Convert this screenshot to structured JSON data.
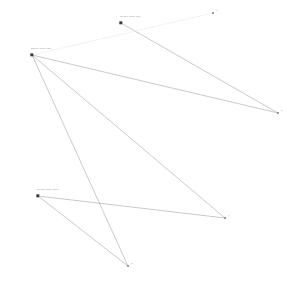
{
  "canvas": {
    "width": 290,
    "height": 292,
    "background": "#ffffff"
  },
  "style": {
    "node_color": "#3a3a3a",
    "endpoint_color": "#9a9a9a",
    "link_color": "#7a7a7a",
    "faint_link_color": "#e2e2e2",
    "caption_color": "#8d8d8d"
  },
  "chart_data": {
    "type": "scatter",
    "title": "",
    "xlabel": "",
    "ylabel": "",
    "xlim": [
      0,
      290
    ],
    "ylim": [
      0,
      292
    ],
    "grid": false,
    "legend": null,
    "nodes": [
      {
        "id": "n1",
        "label": "source node one",
        "x": 121,
        "y": 23
      },
      {
        "id": "n2",
        "label": "source node two",
        "x": 32,
        "y": 55
      },
      {
        "id": "n3",
        "label": "source node three",
        "x": 38,
        "y": 196
      }
    ],
    "endpoints": [
      {
        "id": "e1",
        "label": "a",
        "x": 213,
        "y": 13
      },
      {
        "id": "e2",
        "label": "b",
        "x": 278,
        "y": 113
      },
      {
        "id": "e3",
        "label": "c",
        "x": 225,
        "y": 218
      },
      {
        "id": "e4",
        "label": "d",
        "x": 128,
        "y": 266
      }
    ],
    "links": [
      {
        "from": "n1",
        "to": "e2",
        "weight": 1,
        "faint": false
      },
      {
        "from": "n2",
        "to": "e1",
        "weight": 1,
        "faint": true
      },
      {
        "from": "n2",
        "to": "e2",
        "weight": 1,
        "faint": false
      },
      {
        "from": "n2",
        "to": "e3",
        "weight": 1,
        "faint": false
      },
      {
        "from": "n2",
        "to": "e4",
        "weight": 1,
        "faint": false
      },
      {
        "from": "n3",
        "to": "e3",
        "weight": 1,
        "faint": false
      },
      {
        "from": "n3",
        "to": "e4",
        "weight": 1,
        "faint": false
      }
    ]
  }
}
